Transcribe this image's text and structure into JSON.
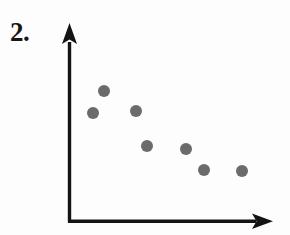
{
  "page": {
    "background_color": "#fdfdfd",
    "width": 290,
    "height": 235
  },
  "question": {
    "number_label": "2.",
    "label_color": "#161616"
  },
  "chart_data": {
    "type": "scatter",
    "title": "",
    "subtitle": "",
    "xlabel": "",
    "ylabel": "",
    "grid": false,
    "legend": null,
    "legend_position": "none",
    "axis_style": "arrow-headed L-shaped axes, no tick marks, no tick labels",
    "axis_color": "#141414",
    "axis_line_width": 3,
    "point_color": "#6b6b6b",
    "point_radius": 6,
    "point_count": 7,
    "xlim": [
      0,
      10
    ],
    "ylim": [
      0,
      10
    ],
    "x": [
      1.3,
      1.9,
      3.6,
      4.2,
      6.3,
      7.2,
      9.2
    ],
    "y": [
      5.8,
      7.2,
      6.0,
      4.1,
      3.9,
      2.8,
      2.8
    ],
    "points": [
      {
        "index": 1,
        "x": 1.3,
        "y": 5.8,
        "px": 93,
        "py": 113
      },
      {
        "index": 2,
        "x": 1.9,
        "y": 7.2,
        "px": 104,
        "py": 91
      },
      {
        "index": 3,
        "x": 3.6,
        "y": 6.0,
        "px": 136,
        "py": 111
      },
      {
        "index": 4,
        "x": 4.2,
        "y": 4.1,
        "px": 147,
        "py": 146
      },
      {
        "index": 5,
        "x": 6.3,
        "y": 3.9,
        "px": 186,
        "py": 149
      },
      {
        "index": 6,
        "x": 7.2,
        "y": 2.8,
        "px": 204,
        "py": 170
      },
      {
        "index": 7,
        "x": 9.2,
        "y": 2.8,
        "px": 242,
        "py": 171
      }
    ],
    "trend": "negative / decreasing association",
    "annotations": []
  },
  "axes": {
    "origin_px": {
      "x": 69,
      "y": 221
    },
    "y_axis": {
      "name": "vertical-axis",
      "x_px": 69,
      "top_px": 24,
      "bottom_px": 223,
      "arrow": "up"
    },
    "x_axis": {
      "name": "horizontal-axis",
      "y_px": 221,
      "left_px": 68,
      "right_px": 272,
      "arrow": "right"
    }
  }
}
